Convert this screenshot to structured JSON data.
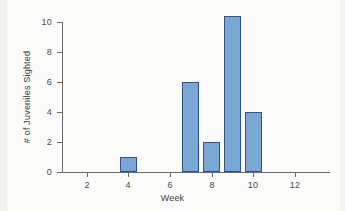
{
  "chart_data": {
    "type": "bar",
    "title": "",
    "subtitle": "",
    "xlabel": "Week",
    "ylabel": "# of Juveniles Sighted",
    "categories": [
      4,
      7,
      8,
      9,
      10
    ],
    "values": [
      1,
      6,
      2,
      10.4,
      4
    ],
    "series": [
      {
        "name": "# of Juveniles Sighted",
        "values": [
          1,
          6,
          2,
          10.4,
          4
        ]
      }
    ],
    "xlim": [
      1,
      13
    ],
    "ylim": [
      0,
      10.8
    ],
    "x_ticks": [
      2,
      4,
      6,
      8,
      10,
      12
    ],
    "y_ticks": [
      0,
      2,
      4,
      6,
      8,
      10
    ],
    "x_tick_labels": [
      "2",
      "4",
      "6",
      "8",
      "10",
      "12"
    ],
    "y_tick_labels": [
      "0",
      "2",
      "4",
      "6",
      "8",
      "10"
    ],
    "grid": false,
    "legend": false,
    "legend_position": "none",
    "bar_fill_color": "#7ba7d4",
    "bar_edge_color": "#33508a",
    "axis_color": "#6b6b6b",
    "background_color": "#fbfbfa",
    "annotations": []
  }
}
